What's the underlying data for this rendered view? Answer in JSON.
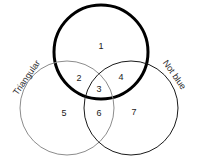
{
  "diagram": {
    "type": "venn-3-set",
    "background_color": "#ffffff",
    "width": 197,
    "height": 164,
    "sets": [
      {
        "id": "top",
        "label": "",
        "stroke_color": "#000000",
        "stroke_width": 3,
        "cx": 101,
        "cy": 52,
        "r": 47,
        "label_x": 0,
        "label_y": 0,
        "label_rotation": 0
      },
      {
        "id": "left",
        "label": "Triangular",
        "stroke_color": "#8c8c8c",
        "stroke_width": 1,
        "cx": 67,
        "cy": 108,
        "r": 47,
        "label_x": 27,
        "label_y": 78,
        "label_rotation": -55
      },
      {
        "id": "right",
        "label": "Not blue",
        "stroke_color": "#1a1a1a",
        "stroke_width": 1,
        "cx": 131,
        "cy": 108,
        "r": 47,
        "label_x": 174,
        "label_y": 75,
        "label_rotation": 55
      }
    ],
    "regions": [
      {
        "id": "top-only",
        "label": "1",
        "x": 101,
        "y": 47
      },
      {
        "id": "top-left",
        "label": "2",
        "x": 79,
        "y": 79
      },
      {
        "id": "triple-overlap",
        "label": "3",
        "x": 99,
        "y": 90
      },
      {
        "id": "top-right",
        "label": "4",
        "x": 121,
        "y": 78
      },
      {
        "id": "left-only",
        "label": "5",
        "x": 64,
        "y": 114
      },
      {
        "id": "left-right",
        "label": "6",
        "x": 99,
        "y": 114
      },
      {
        "id": "right-only",
        "label": "7",
        "x": 134,
        "y": 113
      }
    ]
  }
}
